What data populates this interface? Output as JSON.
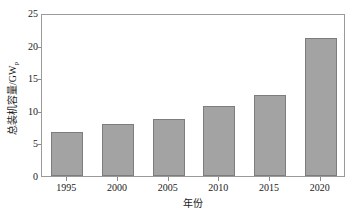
{
  "chart_data": {
    "type": "bar",
    "title": "",
    "categories": [
      "1995",
      "2000",
      "2005",
      "2010",
      "2015",
      "2020"
    ],
    "values": [
      6.8,
      8.0,
      8.8,
      10.8,
      12.5,
      21.1
    ],
    "xlabel": "年份",
    "ylabel": "总装机容量/GW",
    "ylabel_subscript": "p",
    "ylim": [
      0,
      25
    ],
    "yticks": [
      0,
      5,
      10,
      15,
      20,
      25
    ],
    "ytick_labels": [
      "0",
      "5",
      "10",
      "15",
      "20",
      "25"
    ],
    "grid": false,
    "legend": null,
    "series": [
      {
        "name": "总装机容量",
        "values": [
          6.8,
          8.0,
          8.8,
          10.8,
          12.5,
          21.1
        ]
      }
    ],
    "colors": {
      "bar_fill": "#a3a3a3",
      "bar_edge": "#7d7d7d",
      "axis": "#9a9a9a",
      "text": "#1a1a1a",
      "background": "#ffffff"
    }
  }
}
